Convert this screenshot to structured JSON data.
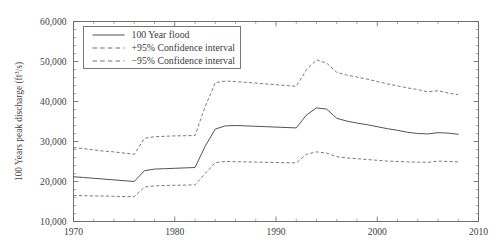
{
  "chart_data": {
    "type": "line",
    "title": "",
    "xlabel": "",
    "ylabel": "100 Years peak discharge (ft³/s)",
    "xlim": [
      1970,
      2010
    ],
    "ylim": [
      10000,
      60000
    ],
    "x_ticks": [
      1970,
      1980,
      1990,
      2000,
      2010
    ],
    "x_tick_labels": [
      "1970",
      "1980",
      "1990",
      "2000",
      "2010"
    ],
    "x_minor_tick_step": 2,
    "y_ticks": [
      10000,
      20000,
      30000,
      40000,
      50000,
      60000
    ],
    "y_tick_labels": [
      "10,000",
      "20,000",
      "30,000",
      "40,000",
      "50,000",
      "60,000"
    ],
    "y_minor_tick_step": 2000,
    "grid": false,
    "legend_position": "top-left-inside",
    "line_color": "#555350",
    "dash_color": "#6d6b66",
    "axis_color": "#66645f",
    "background": "#ffffff",
    "x": [
      1970,
      1971,
      1972,
      1973,
      1974,
      1975,
      1976,
      1977,
      1978,
      1979,
      1980,
      1981,
      1982,
      1983,
      1984,
      1985,
      1986,
      1987,
      1988,
      1989,
      1990,
      1991,
      1992,
      1993,
      1994,
      1995,
      1996,
      1997,
      1998,
      1999,
      2000,
      2001,
      2002,
      2003,
      2004,
      2005,
      2006,
      2007,
      2008
    ],
    "series": [
      {
        "name": "100 Year flood",
        "style": "solid",
        "values": [
          21200,
          21000,
          20800,
          20600,
          20400,
          20200,
          20000,
          22700,
          23100,
          23200,
          23300,
          23400,
          23500,
          28800,
          33100,
          33900,
          34000,
          33900,
          33800,
          33700,
          33600,
          33500,
          33400,
          36600,
          38400,
          38100,
          35800,
          35100,
          34600,
          34200,
          33700,
          33200,
          32800,
          32300,
          32000,
          31900,
          32200,
          32100,
          31800
        ]
      },
      {
        "name": "+95% Confidence interval",
        "style": "dashed",
        "values": [
          28500,
          28200,
          27900,
          27600,
          27400,
          27100,
          26800,
          30800,
          31200,
          31300,
          31400,
          31450,
          31500,
          38700,
          44700,
          45100,
          45000,
          44800,
          44600,
          44400,
          44200,
          44000,
          43800,
          47900,
          50400,
          49600,
          47300,
          46600,
          46100,
          45600,
          45000,
          44400,
          43900,
          43400,
          43000,
          42400,
          42700,
          42100,
          41700
        ]
      },
      {
        "name": "−95% Confidence interval",
        "style": "dashed",
        "values": [
          16500,
          16450,
          16400,
          16350,
          16300,
          16250,
          16200,
          18600,
          18900,
          19000,
          19050,
          19100,
          19150,
          22000,
          24700,
          25000,
          24950,
          24900,
          24850,
          24800,
          24750,
          24700,
          24650,
          26800,
          27400,
          27100,
          26200,
          25900,
          25700,
          25500,
          25300,
          25100,
          25000,
          24900,
          24850,
          24800,
          25100,
          25000,
          24900
        ]
      }
    ],
    "legend": [
      {
        "label": "100 Year flood",
        "style": "solid"
      },
      {
        "label": "+95% Confidence interval",
        "style": "dashed"
      },
      {
        "label": "−95% Confidence interval",
        "style": "dashed"
      }
    ]
  },
  "figure": {
    "caption_fragment": ""
  }
}
